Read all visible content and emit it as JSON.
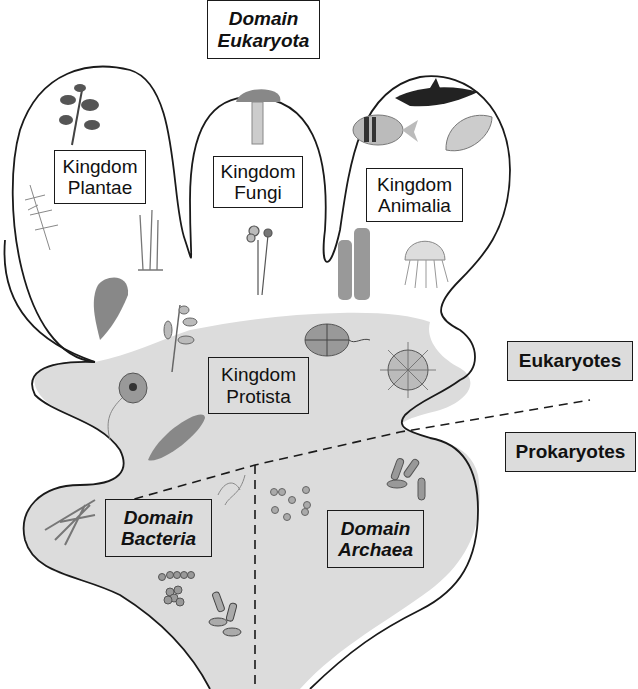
{
  "title": {
    "line1": "Domain",
    "line2": "Eukaryota"
  },
  "kingdoms": {
    "plantae": {
      "line1": "Kingdom",
      "line2": "Plantae"
    },
    "fungi": {
      "line1": "Kingdom",
      "line2": "Fungi"
    },
    "animalia": {
      "line1": "Kingdom",
      "line2": "Animalia"
    },
    "protista": {
      "line1": "Kingdom",
      "line2": "Protista"
    }
  },
  "domains": {
    "bacteria": {
      "line1": "Domain",
      "line2": "Bacteria"
    },
    "archaea": {
      "line1": "Domain",
      "line2": "Archaea"
    }
  },
  "groups": {
    "eukaryotes": "Eukaryotes",
    "prokaryotes": "Prokaryotes"
  },
  "illustrations": {
    "plantae": [
      "leafy-plant",
      "fern",
      "moss",
      "seaweed-frond"
    ],
    "fungi": [
      "mushroom",
      "slime-mold-sporangia"
    ],
    "animalia": [
      "orca",
      "tropical-fish",
      "clam",
      "tube-sponge",
      "jellyfish"
    ],
    "protista": [
      "kelp-like-alga",
      "dinoflagellate",
      "radiolarian",
      "flagellate",
      "diatom"
    ],
    "bacteria": [
      "filamentous-bacteria",
      "spirilla",
      "cocci-chain",
      "cocci-cluster",
      "bacilli-cluster"
    ],
    "archaea": [
      "scattered-cocci",
      "rod-shaped-archaea"
    ]
  },
  "colors": {
    "outline": "#1a1a1a",
    "shaded_region": "#dcdcdc",
    "background": "#ffffff"
  }
}
